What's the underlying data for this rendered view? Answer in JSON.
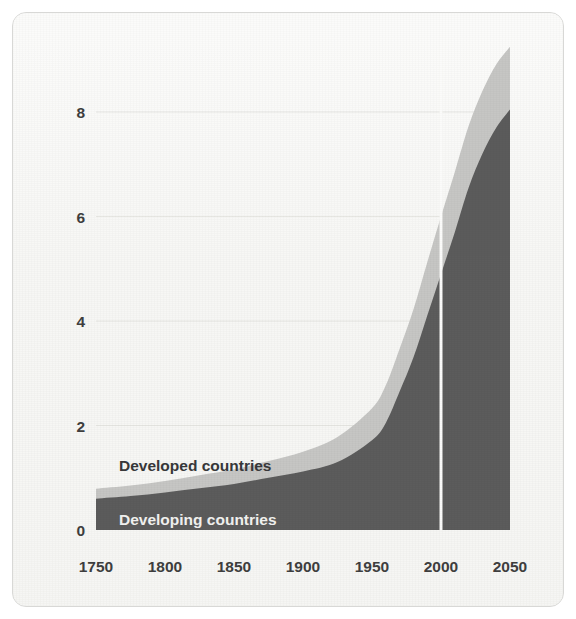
{
  "chart_data": {
    "type": "area",
    "title": "",
    "subtitle": "",
    "xlabel": "",
    "ylabel": "",
    "stacked": true,
    "grid": true,
    "grid_orientation": "horizontal",
    "legend_position": "inline-on-areas",
    "xlim": [
      1750,
      2050
    ],
    "ylim": [
      0,
      9.6
    ],
    "x_ticks": [
      1750,
      1800,
      1850,
      1900,
      1950,
      2000,
      2050
    ],
    "x_tick_labels": [
      "1750",
      "1800",
      "1850",
      "1900",
      "1950",
      "2000",
      "2050"
    ],
    "y_ticks": [
      0,
      2,
      4,
      6,
      8
    ],
    "y_tick_labels": [
      "0",
      "2",
      "4",
      "6",
      "8"
    ],
    "annotations": [
      {
        "name": "projection-divider",
        "x": 2000,
        "label": ""
      }
    ],
    "x": [
      1750,
      1775,
      1800,
      1825,
      1850,
      1875,
      1900,
      1925,
      1950,
      1960,
      1970,
      1980,
      1990,
      2000,
      2010,
      2020,
      2030,
      2040,
      2050
    ],
    "series": [
      {
        "name": "Developing countries",
        "label": "Developing countries",
        "color": "#5c5c5c",
        "label_color": "#f2f2f0",
        "values": [
          0.6,
          0.65,
          0.72,
          0.8,
          0.88,
          1.0,
          1.12,
          1.3,
          1.72,
          2.05,
          2.65,
          3.3,
          4.1,
          4.9,
          5.7,
          6.55,
          7.2,
          7.7,
          8.05
        ]
      },
      {
        "name": "Developed countries",
        "label": "Developed countries",
        "color": "#c6c6c4",
        "label_color": "#38383a",
        "values": [
          0.19,
          0.2,
          0.22,
          0.25,
          0.28,
          0.32,
          0.38,
          0.48,
          0.61,
          0.72,
          0.82,
          0.92,
          1.02,
          1.1,
          1.15,
          1.18,
          1.2,
          1.21,
          1.2
        ]
      }
    ],
    "totals": [
      0.79,
      0.85,
      0.94,
      1.05,
      1.16,
      1.32,
      1.5,
      1.78,
      2.33,
      2.77,
      3.47,
      4.22,
      5.12,
      6.0,
      6.85,
      7.73,
      8.4,
      8.91,
      9.25
    ],
    "units": "billions of people"
  },
  "axis": {
    "y_labels": [
      "8",
      "6",
      "4",
      "2",
      "0"
    ],
    "x_labels": [
      "1750",
      "1800",
      "1850",
      "1900",
      "1950",
      "2000",
      "2050"
    ]
  },
  "legend": {
    "developed": "Developed countries",
    "developing": "Developing countries"
  },
  "colors": {
    "card_background": "#f7f7f5",
    "card_border": "#d8d8d6",
    "developing_area": "#5c5c5c",
    "developed_area": "#c6c6c4",
    "gridline": "#e6e6e2",
    "divider": "#fbfbfa",
    "tick_text": "#3f3f3f"
  }
}
